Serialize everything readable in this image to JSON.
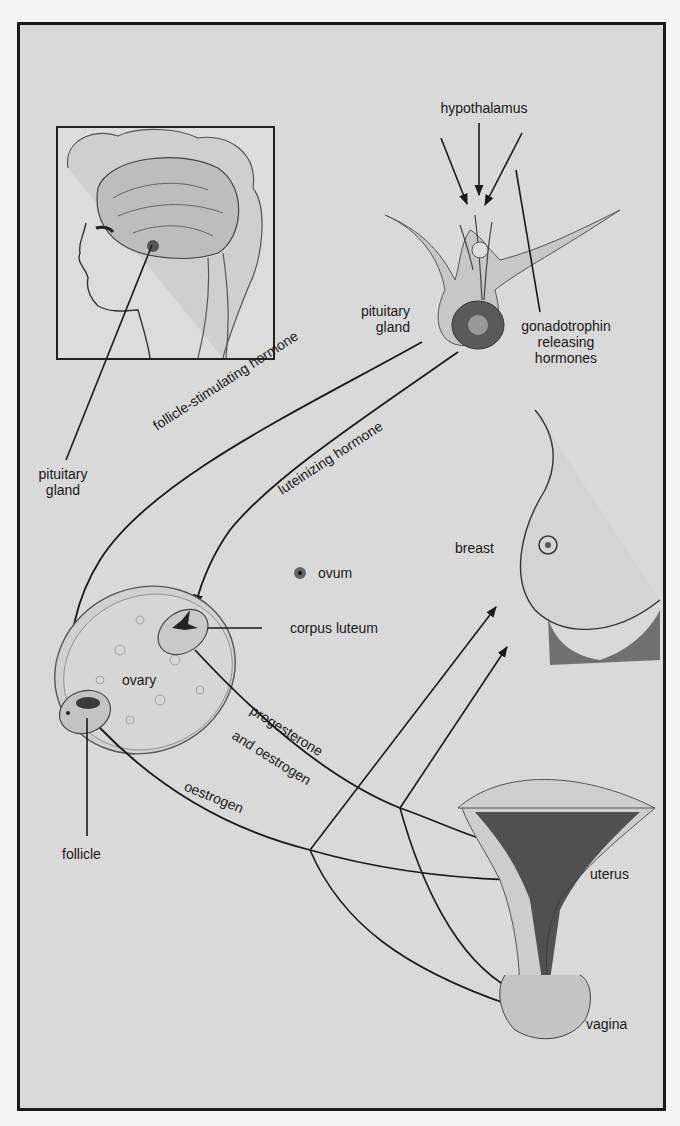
{
  "diagram": {
    "labels": {
      "hypothalamus": "hypothalamus",
      "pituitary_gland_right_line1": "pituitary",
      "pituitary_gland_right_line2": "gland",
      "gonadotrophin_line1": "gonadotrophin",
      "gonadotrophin_line2": "releasing",
      "gonadotrophin_line3": "hormones",
      "pituitary_gland_left_line1": "pituitary",
      "pituitary_gland_left_line2": "gland",
      "fsh": "follicle-stimulating hormone",
      "lh": "luteinizing hormone",
      "ovum": "ovum",
      "corpus_luteum": "corpus luteum",
      "ovary": "ovary",
      "progesterone": "progesterone",
      "and_oestrogen": "and oestrogen",
      "oestrogen": "oestrogen",
      "follicle": "follicle",
      "breast": "breast",
      "uterus": "uterus",
      "vagina": "vagina"
    },
    "colors": {
      "background": "#d9d9d9",
      "line": "#1a1a1a",
      "frame": "#1a1a1a"
    }
  }
}
